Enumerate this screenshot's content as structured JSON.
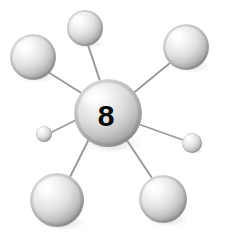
{
  "figure": {
    "background_color": "#ffffff",
    "width": 227,
    "height": 249
  },
  "central_atom": {
    "label": "8",
    "label_color": "#0a0a0a",
    "cx": 108,
    "cy": 113,
    "r": 34,
    "highlight_color": "#ffffff",
    "mid_color": "#d8d8d6",
    "shadow_color": "#8f8f8d"
  },
  "bonds": {
    "color": "#9a9a9a",
    "items": [
      {
        "name": "bond-to-top-left",
        "x1": 86,
        "y1": 96,
        "x2": 48,
        "y2": 72,
        "width": 2.0
      },
      {
        "name": "bond-to-top-center",
        "x1": 100,
        "y1": 81,
        "x2": 88,
        "y2": 45,
        "width": 2.0
      },
      {
        "name": "bond-to-top-right",
        "x1": 131,
        "y1": 95,
        "x2": 170,
        "y2": 63,
        "width": 2.0
      },
      {
        "name": "bond-to-small-left",
        "x1": 76,
        "y1": 120,
        "x2": 52,
        "y2": 132,
        "width": 1.8
      },
      {
        "name": "bond-to-small-right",
        "x1": 141,
        "y1": 125,
        "x2": 183,
        "y2": 140,
        "width": 1.8
      },
      {
        "name": "bond-to-bottom-left",
        "x1": 89,
        "y1": 139,
        "x2": 70,
        "y2": 177,
        "width": 2.0
      },
      {
        "name": "bond-to-bottom-right",
        "x1": 126,
        "y1": 139,
        "x2": 152,
        "y2": 178,
        "width": 2.0
      }
    ]
  },
  "outer_atoms": [
    {
      "name": "atom-top-left",
      "cx": 33,
      "cy": 57,
      "r": 23
    },
    {
      "name": "atom-top-center",
      "cx": 85,
      "cy": 28,
      "r": 18
    },
    {
      "name": "atom-top-right",
      "cx": 186,
      "cy": 47,
      "r": 23
    },
    {
      "name": "atom-small-left",
      "cx": 44,
      "cy": 134,
      "r": 8
    },
    {
      "name": "atom-small-right",
      "cx": 192,
      "cy": 143,
      "r": 10
    },
    {
      "name": "atom-bottom-left",
      "cx": 57,
      "cy": 200,
      "r": 27
    },
    {
      "name": "atom-bottom-right",
      "cx": 163,
      "cy": 199,
      "r": 24
    }
  ],
  "style": {
    "sphere_highlight": "#ffffff",
    "sphere_mid": "#dcdcda",
    "sphere_shadow": "#8d8d8b",
    "sphere_rim": "#b6b6b4"
  }
}
